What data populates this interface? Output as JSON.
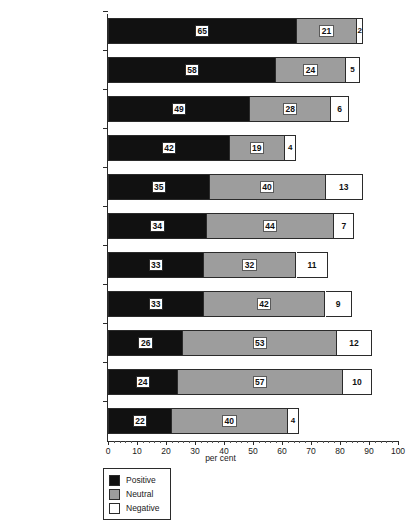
{
  "chart_data": {
    "type": "bar",
    "orientation": "horizontal",
    "stacked": true,
    "title": "",
    "xlabel": "per cent",
    "ylabel": "",
    "xlim": [
      0,
      100
    ],
    "xticks": [
      0,
      10,
      20,
      30,
      40,
      50,
      60,
      70,
      80,
      90,
      100
    ],
    "xtick_labels": [
      "0",
      "10",
      "20",
      "30",
      "40",
      "50",
      "60",
      "70",
      "80",
      "90",
      "100"
    ],
    "grid": false,
    "legend_position": "bottom-left",
    "categories": [
      "Romania",
      "Poland",
      "CANDIDATE COUNTRIES",
      "Bulgaria",
      "Slovenia",
      "Slovakia",
      "Hungary",
      "Czech Republic",
      "Latvia",
      "Estonia",
      "Lithuania"
    ],
    "series": [
      {
        "name": "Positive",
        "color": "#111111",
        "values": [
          65,
          58,
          49,
          42,
          35,
          34,
          33,
          33,
          26,
          24,
          22
        ]
      },
      {
        "name": "Neutral",
        "color": "#9d9d9d",
        "values": [
          21,
          24,
          28,
          19,
          40,
          44,
          32,
          42,
          53,
          57,
          40
        ]
      },
      {
        "name": "Negative",
        "color": "#ffffff",
        "values": [
          2,
          5,
          6,
          4,
          13,
          7,
          11,
          9,
          12,
          10,
          4
        ]
      }
    ]
  },
  "rows": [
    {
      "label": "Romania",
      "emphasis": false,
      "positive": 65,
      "neutral": 21,
      "negative": 2
    },
    {
      "label": "Poland",
      "emphasis": false,
      "positive": 58,
      "neutral": 24,
      "negative": 5
    },
    {
      "label": "CANDIDATE COUNTRIES",
      "emphasis": true,
      "positive": 49,
      "neutral": 28,
      "negative": 6
    },
    {
      "label": "Bulgaria",
      "emphasis": false,
      "positive": 42,
      "neutral": 19,
      "negative": 4
    },
    {
      "label": "Slovenia",
      "emphasis": false,
      "positive": 35,
      "neutral": 40,
      "negative": 13
    },
    {
      "label": "Slovakia",
      "emphasis": false,
      "positive": 34,
      "neutral": 44,
      "negative": 7
    },
    {
      "label": "Hungary",
      "emphasis": false,
      "positive": 33,
      "neutral": 32,
      "negative": 11
    },
    {
      "label": "Czech Republic",
      "emphasis": false,
      "positive": 33,
      "neutral": 42,
      "negative": 9
    },
    {
      "label": "Latvia",
      "emphasis": false,
      "positive": 26,
      "neutral": 53,
      "negative": 12
    },
    {
      "label": "Estonia",
      "emphasis": false,
      "positive": 24,
      "neutral": 57,
      "negative": 10
    },
    {
      "label": "Lithuania",
      "emphasis": false,
      "positive": 22,
      "neutral": 40,
      "negative": 4
    }
  ],
  "legend": {
    "items": [
      {
        "key": "positive",
        "label": "Positive",
        "color": "#111111"
      },
      {
        "key": "neutral",
        "label": "Neutral",
        "color": "#9d9d9d"
      },
      {
        "key": "negative",
        "label": "Negative",
        "color": "#ffffff"
      }
    ]
  },
  "axis": {
    "title": "per cent",
    "ticks": [
      "0",
      "10",
      "20",
      "30",
      "40",
      "50",
      "60",
      "70",
      "80",
      "90",
      "100"
    ]
  },
  "footnote": ""
}
